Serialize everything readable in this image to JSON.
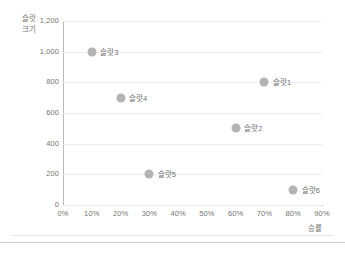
{
  "chart_data": {
    "type": "scatter",
    "title": "",
    "xlabel": "승률",
    "ylabel": "슬랏\n크기",
    "xlim": [
      0,
      90
    ],
    "ylim": [
      0,
      1200
    ],
    "grid": true,
    "legend": "none",
    "x_tick_labels": [
      "0%",
      "10%",
      "20%",
      "30%",
      "40%",
      "50%",
      "60%",
      "70%",
      "80%",
      "90%"
    ],
    "x_tick_values": [
      0,
      10,
      20,
      30,
      40,
      50,
      60,
      70,
      80,
      90
    ],
    "y_tick_labels": [
      "0",
      "200",
      "400",
      "600",
      "800",
      "1,000",
      "1,200"
    ],
    "y_tick_values": [
      0,
      200,
      400,
      600,
      800,
      1000,
      1200
    ],
    "points": [
      {
        "label": "슬랏3",
        "x": 10,
        "y": 1000,
        "size": 9,
        "label_side": "right"
      },
      {
        "label": "슬랏1",
        "x": 70,
        "y": 800,
        "size": 9,
        "label_side": "right"
      },
      {
        "label": "슬랏4",
        "x": 20,
        "y": 700,
        "size": 9,
        "label_side": "right"
      },
      {
        "label": "슬랏2",
        "x": 60,
        "y": 500,
        "size": 9,
        "label_side": "right"
      },
      {
        "label": "슬랏5",
        "x": 30,
        "y": 200,
        "size": 9,
        "label_side": "right"
      },
      {
        "label": "슬랏6",
        "x": 80,
        "y": 100,
        "size": 9,
        "label_side": "right"
      }
    ],
    "marker_color": "#b3b3b3",
    "gridline_color": "#ededed",
    "axis_color": "#b9b9b9",
    "text_color": "#757575"
  }
}
